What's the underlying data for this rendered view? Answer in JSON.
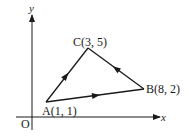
{
  "diagram": {
    "type": "coordinate-triangle",
    "axes": {
      "x_label": "x",
      "y_label": "y",
      "origin_label": "O"
    },
    "points": [
      {
        "id": "A",
        "label": "A(1, 1)",
        "x": 1,
        "y": 1
      },
      {
        "id": "B",
        "label": "B(8, 2)",
        "x": 8,
        "y": 2
      },
      {
        "id": "C",
        "label": "C(3, 5)",
        "x": 3,
        "y": 5
      }
    ],
    "directed_edges": [
      {
        "from": "A",
        "to": "B"
      },
      {
        "from": "B",
        "to": "C"
      },
      {
        "from": "A",
        "to": "C"
      }
    ],
    "colors": {
      "line": "#1a1a1a",
      "background": "#ffffff"
    }
  }
}
